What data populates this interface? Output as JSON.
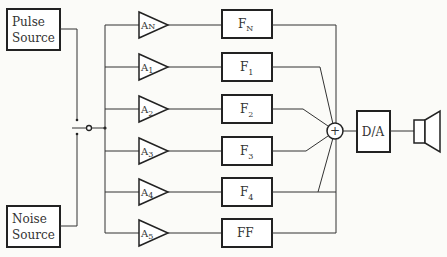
{
  "diagram": {
    "type": "block-diagram",
    "sources": [
      {
        "id": "pulse",
        "line1": "Pulse",
        "line2": "Source"
      },
      {
        "id": "noise",
        "line1": "Noise",
        "line2": "Source"
      }
    ],
    "channels": [
      {
        "amp_main": "A",
        "amp_sub": "N",
        "filter_main": "F",
        "filter_sub": "N"
      },
      {
        "amp_main": "A",
        "amp_sub": "1",
        "filter_main": "F",
        "filter_sub": "1"
      },
      {
        "amp_main": "A",
        "amp_sub": "2",
        "filter_main": "F",
        "filter_sub": "2"
      },
      {
        "amp_main": "A",
        "amp_sub": "3",
        "filter_main": "F",
        "filter_sub": "3"
      },
      {
        "amp_main": "A",
        "amp_sub": "4",
        "filter_main": "F",
        "filter_sub": "4"
      },
      {
        "amp_main": "A",
        "amp_sub": "5",
        "filter_main": "FF",
        "filter_sub": ""
      }
    ],
    "summer": {
      "symbol": "+"
    },
    "converter": {
      "label": "D/A"
    },
    "output": {
      "device": "loudspeaker"
    }
  }
}
